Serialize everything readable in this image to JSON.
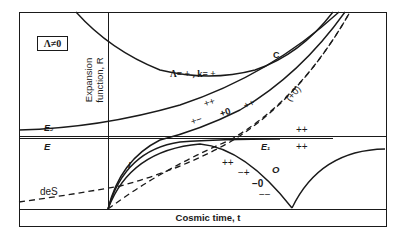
{
  "diagram": {
    "box_label": "Λ≠0",
    "y_axis_label_line1": "Expansion",
    "y_axis_label_line2": "function, R",
    "x_axis_label": "Cosmic time, t",
    "curve_labels": {
      "C": "C",
      "lambda_k": "Λ= + , k= +",
      "E2": "E₂",
      "E": "E",
      "E1": "E₁",
      "I": "I",
      "O": "O",
      "deS": "deS"
    },
    "sign_labels": {
      "pp_upper": "++",
      "pm": "+−",
      "p0": "+0",
      "pp_mid": "++",
      "p0_paren": "(+0)",
      "pp_e1_above": "++",
      "pp_e1_below": "++",
      "pp_o": "++",
      "mp": "−+",
      "m0": "−0",
      "mm": "−−"
    },
    "colors": {
      "ink": "#1a1a1a",
      "background": "#ffffff"
    }
  }
}
